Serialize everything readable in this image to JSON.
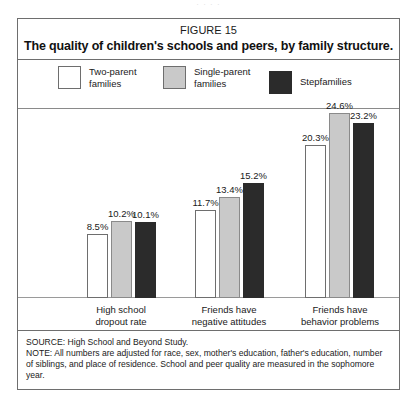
{
  "top_sliver": "·  ·   ·      ·",
  "figure": {
    "number_label": "FIGURE 15",
    "title": "The quality of children's schools and peers, by family structure."
  },
  "legend": {
    "items": [
      {
        "label": "Two-parent\nfamilies",
        "swatch": "white-square-icon",
        "color": "#ffffff"
      },
      {
        "label": "Single-parent\nfamilies",
        "swatch": "gray-square-icon",
        "color": "#c9c9c9"
      },
      {
        "label": "Stepfamilies",
        "swatch": "dark-square-icon",
        "color": "#2b2b2b"
      }
    ]
  },
  "footer": {
    "source": "SOURCE: High School and Beyond Study.",
    "note": "NOTE: All numbers are adjusted for race, sex, mother's education, father's education, number of siblings, and place of residence. School and peer quality are measured in the sophomore year."
  },
  "chart_data": {
    "type": "bar",
    "title": "The quality of children's schools and peers, by family structure.",
    "subtitle": "FIGURE 15",
    "xlabel": "",
    "ylabel": "",
    "ylim": [
      0,
      26
    ],
    "grid": false,
    "legend_position": "top",
    "value_suffix": "%",
    "categories": [
      "High school\ndropout rate",
      "Friends have\nnegative attitudes",
      "Friends have\nbehavior problems"
    ],
    "series": [
      {
        "name": "Two-parent families",
        "color": "#ffffff",
        "values": [
          8.5,
          11.7,
          20.3
        ],
        "labels": [
          "8.5%",
          "11.7%",
          "20.3%"
        ]
      },
      {
        "name": "Single-parent families",
        "color": "#c9c9c9",
        "values": [
          10.2,
          13.4,
          24.6
        ],
        "labels": [
          "10.2%",
          "13.4%",
          "24.6%"
        ]
      },
      {
        "name": "Stepfamilies",
        "color": "#2b2b2b",
        "values": [
          10.1,
          15.2,
          23.2
        ],
        "labels": [
          "10.1%",
          "15.2%",
          "23.2%"
        ]
      }
    ],
    "annotations": [
      "SOURCE: High School and Beyond Study.",
      "NOTE: All numbers are adjusted for race, sex, mother's education, father's education, number of siblings, and place of residence. School and peer quality are measured in the sophomore year."
    ]
  }
}
